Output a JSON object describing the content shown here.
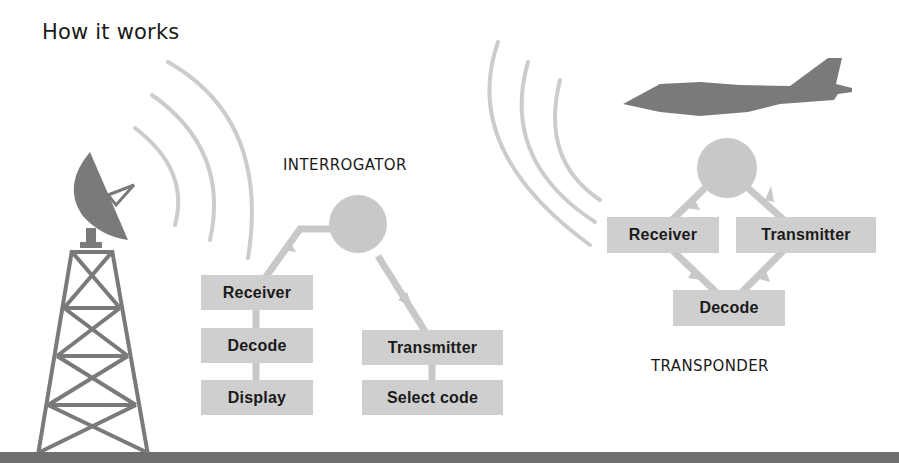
{
  "title": "How it works",
  "interrogator": {
    "label": "INTERROGATOR",
    "boxes": [
      "Receiver",
      "Decode",
      "Display",
      "Transmitter",
      "Select code"
    ]
  },
  "transponder": {
    "label": "TRANSPONDER",
    "boxes": [
      "Receiver",
      "Transmitter",
      "Decode"
    ]
  },
  "colors": {
    "box_fill": "#cfcfcf",
    "flow_line": "#c8c8c8",
    "silhouette": "#7a7a7a",
    "ground": "#6e6e6e",
    "text": "#1a1a1a"
  },
  "icons": [
    "radar-dish-icon",
    "lattice-tower-icon",
    "jet-aircraft-icon",
    "radio-wave-icon"
  ]
}
